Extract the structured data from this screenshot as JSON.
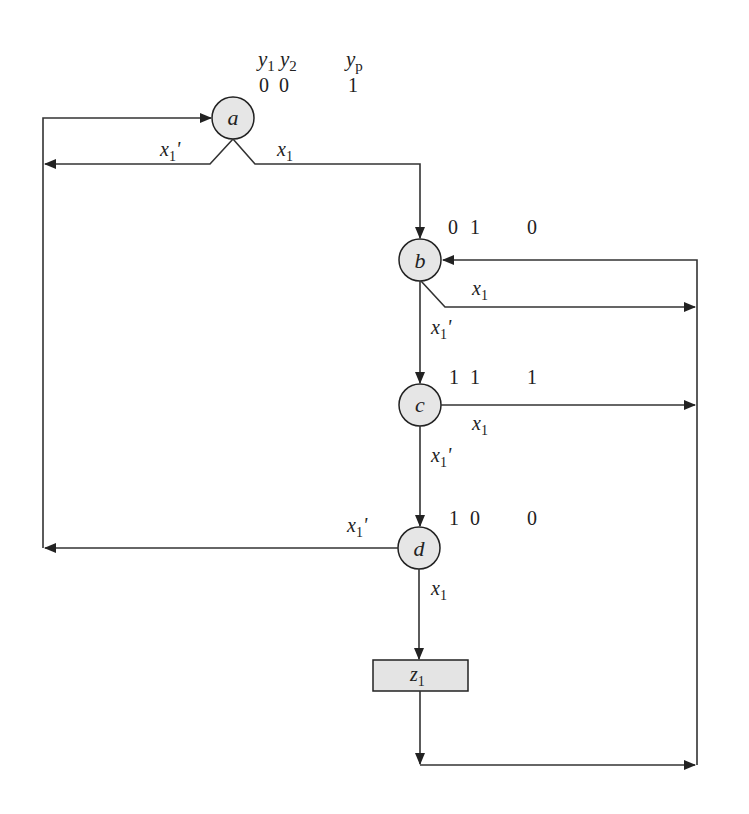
{
  "diagram": {
    "type": "ASM / state diagram (Moore machine)",
    "header": {
      "state_var_1": {
        "base": "y",
        "sub": "1"
      },
      "state_var_2": {
        "base": "y",
        "sub": "2"
      },
      "output_var": {
        "base": "y",
        "sub": "p"
      }
    },
    "states": [
      {
        "id": "a",
        "label": "a",
        "code": [
          "0",
          "0"
        ],
        "yp": "1"
      },
      {
        "id": "b",
        "label": "b",
        "code": [
          "0",
          "1"
        ],
        "yp": "0"
      },
      {
        "id": "c",
        "label": "c",
        "code": [
          "1",
          "1"
        ],
        "yp": "1"
      },
      {
        "id": "d",
        "label": "d",
        "code": [
          "1",
          "0"
        ],
        "yp": "0"
      }
    ],
    "output_box": {
      "base": "z",
      "sub": "1"
    },
    "conditions": {
      "x1": {
        "base": "x",
        "sub": "1",
        "prime": ""
      },
      "x1_not": {
        "base": "x",
        "sub": "1",
        "prime": "'"
      }
    },
    "transitions": [
      {
        "from": "a",
        "to": "a",
        "condition": "x1'"
      },
      {
        "from": "a",
        "to": "b",
        "condition": "x1"
      },
      {
        "from": "b",
        "to": "b",
        "condition": "x1"
      },
      {
        "from": "b",
        "to": "c",
        "condition": "x1'"
      },
      {
        "from": "c",
        "to": "b",
        "condition": "x1"
      },
      {
        "from": "c",
        "to": "d",
        "condition": "x1'"
      },
      {
        "from": "d",
        "to": "a",
        "condition": "x1'"
      },
      {
        "from": "d",
        "to": "z1",
        "condition": "x1"
      },
      {
        "from": "z1",
        "to": "b",
        "condition": ""
      }
    ]
  }
}
